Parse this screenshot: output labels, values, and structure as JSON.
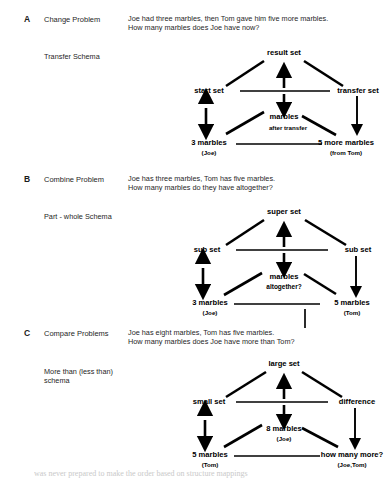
{
  "page": {
    "background": "#ffffff",
    "ink": "#111111",
    "caption_partial": "was never prepared to make the order based on structure mappings"
  },
  "sections": [
    {
      "letter": "A",
      "title": "Change Problem",
      "schema_label": "Transfer Schema",
      "problem": "Joe had three marbles, then Tom gave him five more marbles.\nHow many marbles does Joe have now?",
      "diagram": {
        "top": "result set",
        "left": "start set",
        "right": "transfer set",
        "center": "marbles",
        "center_sub": "after transfer",
        "bottom_left": "3 marbles",
        "bottom_left_sub": "(Joe)",
        "bottom_right": "5 more marbles",
        "bottom_right_sub": "(from Tom)"
      }
    },
    {
      "letter": "B",
      "title": "Combine Problem",
      "schema_label": "Part - whole Schema",
      "problem": "Joe has three marbles, Tom has five marbles.\nHow many marbles do they have altogether?",
      "diagram": {
        "top": "super set",
        "left": "sub set",
        "right": "sub set",
        "center": "marbles",
        "center_sub": "altogether?",
        "bottom_left": "3 marbles",
        "bottom_left_sub": "(Joe)",
        "bottom_right": "5  marbles",
        "bottom_right_sub": "(Tom)"
      }
    },
    {
      "letter": "C",
      "title": "Compare Problems",
      "schema_label": "More than (less than)\nschema",
      "problem": "Joe has eight marbles, Tom has five marbles.\nHow many marbles does Joe have more than Tom?",
      "diagram": {
        "top": "large set",
        "left": "small set",
        "right": "difference",
        "center": "8 marbles",
        "center_sub": "(Joe)",
        "bottom_left": "5 marbles",
        "bottom_left_sub": "(Tom)",
        "bottom_right": "how many more?",
        "bottom_right_sub": "(Joe,Tom)"
      }
    }
  ]
}
